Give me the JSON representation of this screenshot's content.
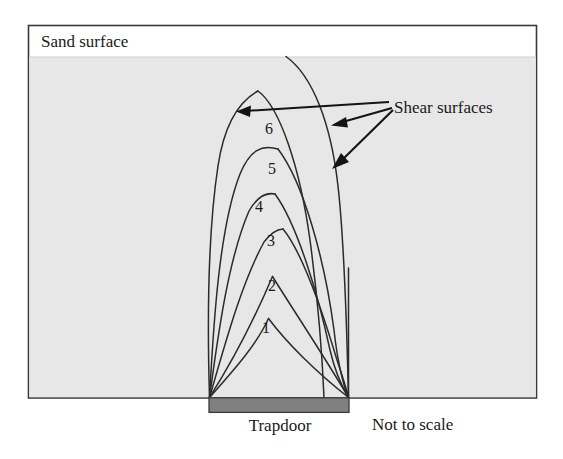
{
  "figure": {
    "labels": {
      "sand_surface": "Sand surface",
      "shear_surfaces": "Shear surfaces",
      "trapdoor": "Trapdoor",
      "not_to_scale": "Not to scale"
    },
    "curve_numbers": [
      "1",
      "2",
      "3",
      "4",
      "5",
      "6"
    ],
    "colors": {
      "sand_fill": "#e7e7e7",
      "surface_band": "#ffffff",
      "trapdoor_fill": "#808080",
      "frame_stroke": "#3a3a3a",
      "curve_stroke": "#2b2b2b",
      "arrow_stroke": "#141414",
      "text": "#1a1a1a"
    },
    "curve_label_positions": [
      {
        "n": "1",
        "x": 266,
        "y": 333
      },
      {
        "n": "2",
        "x": 272,
        "y": 291
      },
      {
        "n": "3",
        "x": 271,
        "y": 246
      },
      {
        "n": "4",
        "x": 259,
        "y": 212
      },
      {
        "n": "5",
        "x": 272,
        "y": 174
      },
      {
        "n": "6",
        "x": 269,
        "y": 134
      }
    ]
  }
}
